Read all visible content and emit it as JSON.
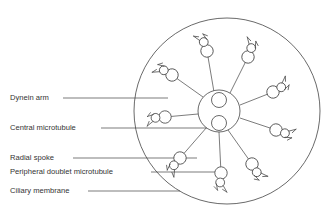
{
  "figure": {
    "kind": "cilium-cross-section-diagram",
    "background_color": "#ffffff",
    "stroke_color": "#444444",
    "text_color": "#333333"
  },
  "labels": [
    {
      "id": "dynein-arm",
      "text": "Dynein arm",
      "x": 10,
      "y": 98,
      "line_x1": 63,
      "line_x2": 168,
      "line_y": 98
    },
    {
      "id": "central-microtubule",
      "text": "Central microtubule",
      "x": 10,
      "y": 128,
      "line_x1": 101,
      "line_x2": 215,
      "line_y": 128
    },
    {
      "id": "radial-spoke",
      "text": "Radial spoke",
      "x": 10,
      "y": 158,
      "line_x1": 73,
      "line_x2": 197,
      "line_y": 158
    },
    {
      "id": "peripheral-doublet-microtubule",
      "text": "Peripheral doublet microtubule",
      "x": 10,
      "y": 172,
      "line_x1": 151,
      "line_x2": 221,
      "line_y": 172
    },
    {
      "id": "ciliary-membrane",
      "text": "Ciliary membrane",
      "x": 10,
      "y": 191,
      "line_x1": 88,
      "line_x2": 180,
      "line_y": 191
    }
  ],
  "membrane": {
    "cx": 227,
    "cy": 111,
    "r": 93
  },
  "central_pair": {
    "sheath": {
      "cx": 219,
      "cy": 111,
      "r": 21
    },
    "microtubules": [
      {
        "cx": 219,
        "cy": 100,
        "r": 7.5
      },
      {
        "cx": 219,
        "cy": 123,
        "r": 7.5
      }
    ]
  },
  "doublets": [
    {
      "id": "d1",
      "cx": 207,
      "cy": 51,
      "angle": 250,
      "spoke_to": [
        214,
        92
      ]
    },
    {
      "id": "d2",
      "cx": 248,
      "cy": 57,
      "angle": 290,
      "spoke_to": [
        230,
        93
      ]
    },
    {
      "id": "d3",
      "cx": 273,
      "cy": 92,
      "angle": 330,
      "spoke_to": [
        240,
        105
      ]
    },
    {
      "id": "d4",
      "cx": 276,
      "cy": 130,
      "angle": 20,
      "spoke_to": [
        240,
        118
      ]
    },
    {
      "id": "d5",
      "cx": 252,
      "cy": 164,
      "angle": 60,
      "spoke_to": [
        228,
        130
      ]
    },
    {
      "id": "d6",
      "cx": 221,
      "cy": 173,
      "angle": 95,
      "spoke_to": [
        219,
        132
      ]
    },
    {
      "id": "d7",
      "cx": 180,
      "cy": 158,
      "angle": 130,
      "spoke_to": [
        207,
        127
      ]
    },
    {
      "id": "d8",
      "cx": 165,
      "cy": 117,
      "angle": 175,
      "spoke_to": [
        198,
        114
      ]
    },
    {
      "id": "d9",
      "cx": 172,
      "cy": 75,
      "angle": 210,
      "spoke_to": [
        203,
        97
      ]
    }
  ],
  "counts": {
    "peripheral_doublets": 9,
    "central_microtubules": 2
  }
}
